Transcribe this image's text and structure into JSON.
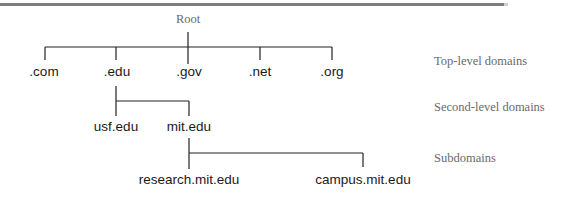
{
  "diagram": {
    "root": {
      "label": "Root"
    },
    "top_level": [
      {
        "label": ".com"
      },
      {
        "label": ".edu"
      },
      {
        "label": ".gov"
      },
      {
        "label": ".net"
      },
      {
        "label": ".org"
      }
    ],
    "second_level": [
      {
        "label": "usf.edu",
        "parent": ".edu"
      },
      {
        "label": "mit.edu",
        "parent": ".edu"
      }
    ],
    "subdomains": [
      {
        "label": "research.mit.edu",
        "parent": "mit.edu"
      },
      {
        "label": "campus.mit.edu",
        "parent": "mit.edu"
      }
    ],
    "level_labels": {
      "top_level": "Top-level domains",
      "second_level": "Second-level domains",
      "subdomains": "Subdomains"
    },
    "colors": {
      "line": "#222222",
      "node_text": "#1a1a1a",
      "level_text": "#6a6a6a",
      "top_rule": "#7d7d7d"
    }
  }
}
